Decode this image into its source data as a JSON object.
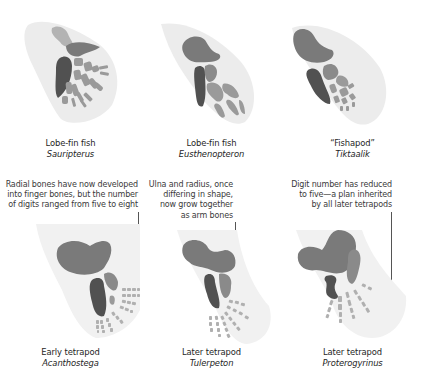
{
  "figure": {
    "topic": "Fin-to-limb transition",
    "colors": {
      "fin_outline": "#ececec",
      "upper_bone": "#7a7a7a",
      "ulna_dark": "#515151",
      "radial_medium": "#8c8c8c",
      "radial_light": "#b0b0b0",
      "leader_line": "#555555"
    },
    "rows": [
      {
        "row": "top",
        "panels": [
          {
            "common_name": "Lobe-fin fish",
            "genus": "Sauripterus"
          },
          {
            "common_name": "Lobe-fin fish",
            "genus": "Eusthenopteron"
          },
          {
            "common_name": "“Fishapod”",
            "genus": "Tiktaalik"
          }
        ]
      },
      {
        "row": "bottom",
        "panels": [
          {
            "common_name": "Early tetrapod",
            "genus": "Acanthostega",
            "annotation": [
              "Radial bones have now developed",
              "into finger bones, but the number",
              "of digits ranged from five to eight"
            ]
          },
          {
            "common_name": "Later tetrapod",
            "genus": "Tulerpeton",
            "annotation": [
              "Ulna and radius, once",
              "differing in shape,",
              "now grow together",
              "as arm bones"
            ]
          },
          {
            "common_name": "Later tetrapod",
            "genus": "Proterogyrinus",
            "annotation": [
              "Digit number has reduced",
              "to five—a plan inherited",
              "by all later tetrapods"
            ]
          }
        ]
      }
    ]
  }
}
